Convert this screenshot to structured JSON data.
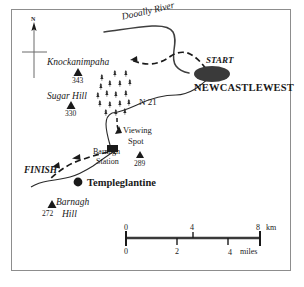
{
  "map": {
    "title_hidden": "",
    "compass": {
      "north_label": "N",
      "icon": "compass-cross-north-arrow"
    },
    "features": {
      "river": {
        "label": "Dooally River",
        "type": "river"
      },
      "road": {
        "label": "N 21",
        "type": "road"
      }
    },
    "route": {
      "start_label": "START",
      "finish_label": "FINISH"
    },
    "settlements": [
      {
        "name": "NEWCASTLEWEST",
        "marker": "town-oval"
      },
      {
        "name": "Templeglantine",
        "marker": "town-dot"
      }
    ],
    "places": [
      {
        "name": "Viewing",
        "name2": "Spot",
        "marker": "viewing-spot-arrow"
      },
      {
        "name": "Barnagh",
        "name2": "Station",
        "marker": "station-square"
      }
    ],
    "peaks": [
      {
        "name": "Knockanimpaha",
        "elevation": "343"
      },
      {
        "name": "Sugar Hill",
        "elevation": "330"
      },
      {
        "name": "",
        "elevation": "289"
      },
      {
        "name": "Barnagh",
        "name2": "Hill",
        "elevation": "272"
      }
    ],
    "forest": {
      "label": "",
      "symbol": "conifer-trees"
    },
    "scale": {
      "km": {
        "ticks": [
          "0",
          "4",
          "8"
        ],
        "unit": "km"
      },
      "miles": {
        "ticks": [
          "0",
          "2",
          "4"
        ],
        "unit": "miles"
      }
    },
    "colors": {
      "ink": "#1a1a1a",
      "frame": "#8d8d8d",
      "town": "#3a3a3a",
      "paper": "#ffffff"
    }
  }
}
